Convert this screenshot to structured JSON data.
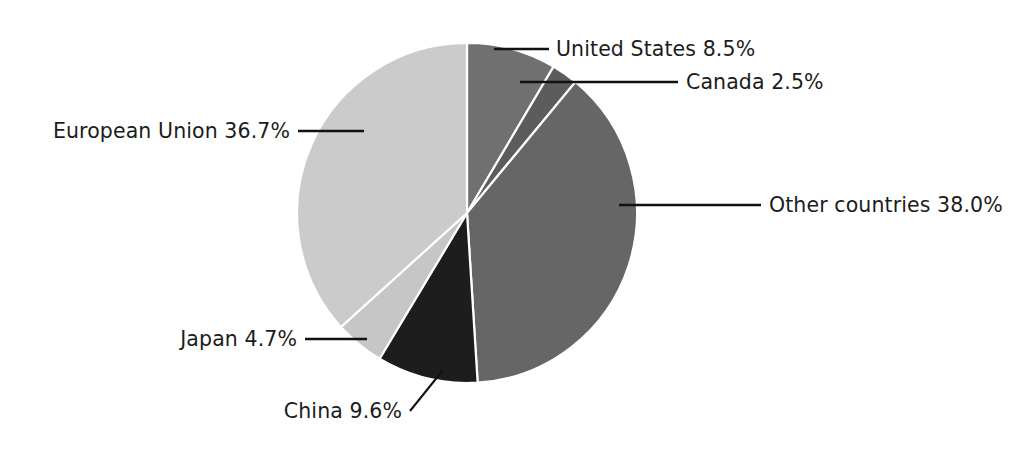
{
  "chart_data": {
    "type": "pie",
    "title": "",
    "subtitle": "",
    "xlabel": "",
    "ylabel": "",
    "legend_position": "none",
    "grid": false,
    "labels_outside": true,
    "start_angle_deg": 0,
    "direction": "clockwise",
    "units": "percent",
    "categories": [
      "United States",
      "Canada",
      "Other countries",
      "China",
      "Japan",
      "European Union"
    ],
    "values": [
      8.5,
      2.5,
      38.0,
      9.6,
      4.7,
      36.7
    ],
    "slices": [
      {
        "name": "United States",
        "value": 8.5,
        "value_text": "8.5%",
        "label": "United States 8.5%",
        "color": "#707070"
      },
      {
        "name": "Canada",
        "value": 2.5,
        "value_text": "2.5%",
        "label": "Canada 2.5%",
        "color": "#5c5c5c"
      },
      {
        "name": "Other countries",
        "value": 38.0,
        "value_text": "38.0%",
        "label": "Other countries 38.0%",
        "color": "#666666"
      },
      {
        "name": "China",
        "value": 9.6,
        "value_text": "9.6%",
        "label": "China 9.6%",
        "color": "#1d1d1d"
      },
      {
        "name": "Japan",
        "value": 4.7,
        "value_text": "4.7%",
        "label": "Japan 4.7%",
        "color": "#c6c6c6"
      },
      {
        "name": "European Union",
        "value": 36.7,
        "value_text": "36.7%",
        "label": "European Union 36.7%",
        "color": "#cbcbcb"
      }
    ]
  },
  "canvas": {
    "background": "#ffffff",
    "separator_color": "#ffffff",
    "text_color": "#1c1c1c",
    "leader_color": "#111111",
    "center_x": 467,
    "center_y": 213,
    "radius": 170
  }
}
